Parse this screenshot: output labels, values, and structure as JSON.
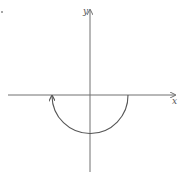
{
  "diagram": {
    "type": "coordinate-sketch",
    "x_axis_label": "x",
    "y_axis_label": "y",
    "curve": {
      "description": "lower semicircle centered at origin",
      "direction": "traversed from right end on x-axis, down through negative y-axis, back up to left end; arrowhead at left end pointing up",
      "radius_units": 1,
      "start": [
        1,
        0
      ],
      "bottom": [
        0,
        -1
      ],
      "end": [
        -1,
        0
      ]
    },
    "colors": {
      "axis": "#707070",
      "curve": "#555555"
    }
  }
}
